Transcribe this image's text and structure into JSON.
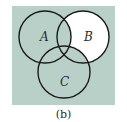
{
  "diagram": {
    "type": "venn",
    "caption": "(b)",
    "colors": {
      "shaded": "#b9d0c9",
      "unshaded": "#ffffff",
      "stroke": "#1a1a1a"
    },
    "sets": [
      {
        "id": "A",
        "label": "A"
      },
      {
        "id": "B",
        "label": "B"
      },
      {
        "id": "C",
        "label": "C"
      }
    ],
    "shaded_region": "Complement of (B − A − C): everything shaded except the part of B outside A and C",
    "unshaded_region": "B only (B ∩ A' ∩ C')"
  }
}
